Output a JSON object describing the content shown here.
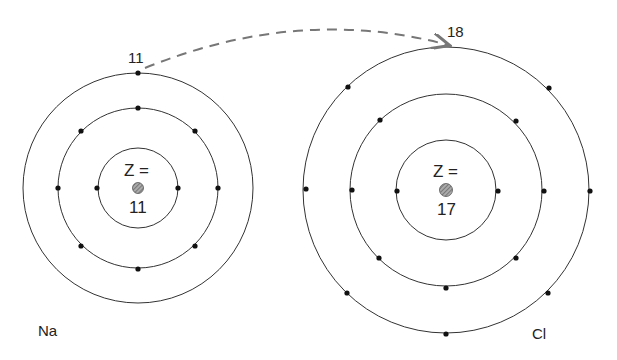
{
  "atoms": [
    {
      "symbol": "Na",
      "z_label": "Z =",
      "z_value": "11",
      "electron_label": "11",
      "shells": [
        2,
        8,
        1
      ]
    },
    {
      "symbol": "Cl",
      "z_label": "Z =",
      "z_value": "17",
      "electron_label": "18",
      "shells": [
        2,
        8,
        7
      ]
    }
  ],
  "transfer": {
    "from": "Na",
    "to": "Cl",
    "style": "dashed-arrow",
    "color": "#777777"
  },
  "colors": {
    "ring": "#333333",
    "electron": "#111111",
    "nucleus": "#888888"
  }
}
